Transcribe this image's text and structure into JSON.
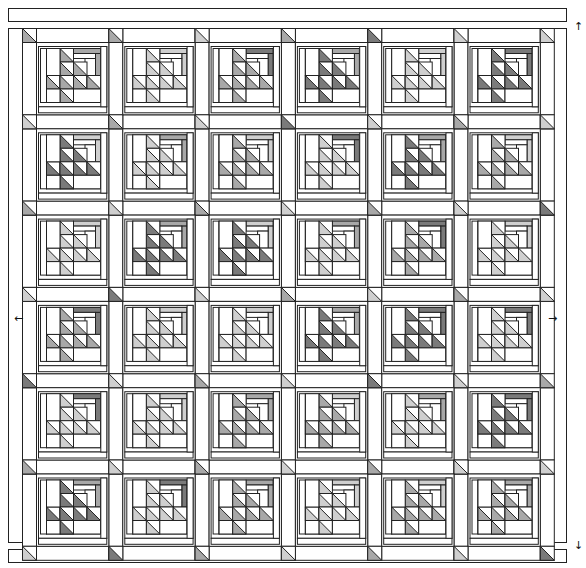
{
  "diagram": {
    "grid": {
      "rows": 6,
      "cols": 6
    },
    "colors": {
      "stroke": "#222222",
      "white": "#ffffff",
      "light": "#cfcfcf",
      "medium": "#a8a8a8",
      "dark": "#7a7a7a"
    },
    "border": {
      "top_strip": "border-strip-top",
      "bottom_strip": "border-strip-bottom"
    },
    "arrows": {
      "top_right": "↑",
      "bottom_right": "↓",
      "left_mid": "←",
      "right_mid": "→"
    },
    "block_shades": [
      [
        "medium",
        "light",
        "medium",
        "dark",
        "light",
        "dark"
      ],
      [
        "dark",
        "light",
        "medium",
        "light",
        "dark",
        "medium"
      ],
      [
        "light",
        "dark",
        "dark",
        "light",
        "medium",
        "light"
      ],
      [
        "medium",
        "light",
        "light",
        "dark",
        "dark",
        "light"
      ],
      [
        "light",
        "light",
        "medium",
        "medium",
        "light",
        "dark"
      ],
      [
        "dark",
        "light",
        "medium",
        "light",
        "medium",
        "medium"
      ]
    ],
    "bar_shades": [
      [
        "medium",
        "light",
        "dark",
        "medium",
        "light",
        "dark"
      ],
      [
        "light",
        "medium",
        "light",
        "dark",
        "medium",
        "light"
      ],
      [
        "light",
        "medium",
        "light",
        "medium",
        "dark",
        "light"
      ],
      [
        "dark",
        "light",
        "light",
        "medium",
        "dark",
        "dark"
      ],
      [
        "dark",
        "light",
        "medium",
        "light",
        "medium",
        "dark"
      ],
      [
        "medium",
        "dark",
        "medium",
        "light",
        "light",
        "medium"
      ]
    ],
    "cornerstone_shades": [
      [
        "medium",
        "medium",
        "light",
        "medium",
        "dark",
        "light",
        "light"
      ],
      [
        "light",
        "medium",
        "light",
        "dark",
        "light",
        "medium",
        "light"
      ],
      [
        "medium",
        "light",
        "medium",
        "light",
        "medium",
        "light",
        "dark"
      ],
      [
        "light",
        "dark",
        "light",
        "medium",
        "light",
        "medium",
        "light"
      ],
      [
        "dark",
        "light",
        "medium",
        "light",
        "dark",
        "light",
        "medium"
      ],
      [
        "medium",
        "light",
        "medium",
        "light",
        "medium",
        "light",
        "light"
      ],
      [
        "light",
        "dark",
        "medium",
        "light",
        "medium",
        "light",
        "dark"
      ]
    ]
  }
}
